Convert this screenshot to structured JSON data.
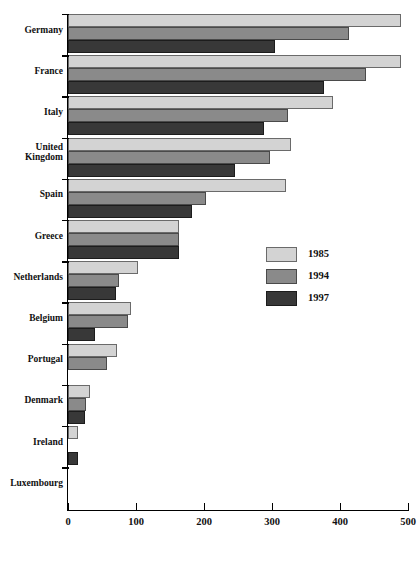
{
  "chart_data": {
    "type": "bar",
    "orientation": "horizontal",
    "title": "",
    "xlabel": "",
    "ylabel": "",
    "xlim": [
      0,
      500
    ],
    "xticks": [
      0,
      100,
      200,
      300,
      400,
      500
    ],
    "xtick_labels": [
      "0",
      "100",
      "200",
      "300",
      "400",
      "500"
    ],
    "grid": false,
    "legend_position": "middle-right",
    "categories": [
      "Germany",
      "France",
      "Italy",
      "United Kingdom",
      "Spain",
      "Greece",
      "Netherlands",
      "Belgium",
      "Portugal",
      "Denmark",
      "Ireland",
      "Luxembourg"
    ],
    "series": [
      {
        "name": "1985",
        "color": "#d3d3d3",
        "values": [
          490,
          490,
          389,
          328,
          320,
          163,
          103,
          93,
          72,
          32,
          14,
          0
        ]
      },
      {
        "name": "1994",
        "color": "#8a8a8a",
        "values": [
          413,
          438,
          324,
          297,
          203,
          163,
          75,
          88,
          57,
          26,
          0,
          0
        ]
      },
      {
        "name": "1997",
        "color": "#383838",
        "values": [
          304,
          376,
          288,
          245,
          183,
          163,
          71,
          40,
          0,
          25,
          14,
          0
        ]
      }
    ]
  },
  "legend": {
    "items": [
      {
        "label": "1985",
        "swatch": "y1985"
      },
      {
        "label": "1994",
        "swatch": "y1994"
      },
      {
        "label": "1997",
        "swatch": "y1997"
      }
    ]
  }
}
